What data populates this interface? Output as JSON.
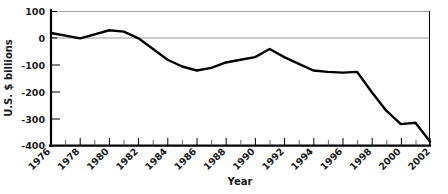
{
  "chart_data": {
    "type": "line",
    "title": "",
    "xlabel": "Year",
    "ylabel": "U.S. $ billions",
    "grid": "horizontal gridlines at y=100 and y=0 only",
    "legend": "none",
    "xlim": [
      1976,
      2002
    ],
    "ylim": [
      -400,
      100
    ],
    "ytick_labels": [
      "100",
      "0",
      "-100",
      "-200",
      "-300",
      "-400"
    ],
    "yticks": [
      100,
      0,
      -100,
      -200,
      -300,
      -400
    ],
    "xtick_labels": [
      "1976",
      "1978",
      "1980",
      "1982",
      "1984",
      "1986",
      "1988",
      "1990",
      "1992",
      "1994",
      "1996",
      "1998",
      "2000",
      "2002"
    ],
    "xticks": [
      1976,
      1978,
      1980,
      1982,
      1984,
      1986,
      1988,
      1990,
      1992,
      1994,
      1996,
      1998,
      2000,
      2002
    ],
    "xtick_rotation_degrees": 45,
    "x": [
      1976,
      1977,
      1978,
      1979,
      1980,
      1981,
      1982,
      1983,
      1984,
      1985,
      1986,
      1987,
      1988,
      1989,
      1990,
      1991,
      1992,
      1993,
      1994,
      1995,
      1996,
      1997,
      1998,
      1999,
      2000,
      2001,
      2002
    ],
    "values": [
      20,
      10,
      0,
      15,
      30,
      25,
      0,
      -40,
      -80,
      -105,
      -120,
      -110,
      -90,
      -80,
      -70,
      -40,
      -70,
      -95,
      -120,
      -125,
      -128,
      -125,
      -200,
      -270,
      -320,
      -315,
      -385
    ],
    "series": [
      {
        "name": "U.S. current account balance",
        "values": [
          20,
          10,
          0,
          15,
          30,
          25,
          0,
          -40,
          -80,
          -105,
          -120,
          -110,
          -90,
          -80,
          -70,
          -40,
          -70,
          -95,
          -120,
          -125,
          -128,
          -125,
          -200,
          -270,
          -320,
          -315,
          -385
        ],
        "color": "#000000"
      }
    ]
  },
  "axes": {
    "y_axis_label": "U.S. $ billions",
    "x_axis_label": "Year"
  },
  "colors": {
    "line": "#000000",
    "grid": "#8c8c8c",
    "axis": "#000000",
    "background": "#ffffff",
    "text": "#1a1a1a"
  }
}
